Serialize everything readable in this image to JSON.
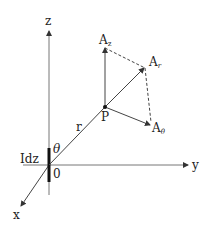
{
  "diagram": {
    "axes": {
      "z_label": "z",
      "y_label": "y",
      "x_label": "x",
      "origin_label": "0"
    },
    "current_element_label": "Idz",
    "angle_label": "θ",
    "radius_label": "r",
    "point_label": "P",
    "vectors": [
      {
        "name": "A",
        "sub": "z"
      },
      {
        "name": "A",
        "sub": "r"
      },
      {
        "name": "A",
        "sub": "θ"
      }
    ],
    "colors": {
      "line": "#444444",
      "text": "#222222",
      "background": "#ffffff"
    }
  }
}
